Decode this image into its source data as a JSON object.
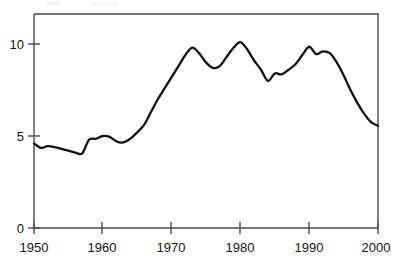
{
  "chart_data": {
    "type": "line",
    "title": "",
    "subtitle": "",
    "xlabel": "",
    "ylabel": "",
    "xlim": [
      1950,
      2000
    ],
    "ylim": [
      0,
      11.6
    ],
    "grid": false,
    "legend": null,
    "series_color": "#111111",
    "x_ticks": [
      1950,
      1960,
      1970,
      1980,
      1990,
      2000
    ],
    "x_tick_labels": [
      "1950",
      "1960",
      "1970",
      "1980",
      "1990",
      "2000"
    ],
    "y_ticks": [
      0,
      5,
      10
    ],
    "y_tick_labels": [
      "0",
      "5",
      "10"
    ],
    "series": [
      {
        "name": "rate",
        "x": [
          1950,
          1951,
          1952,
          1953,
          1954,
          1955,
          1956,
          1957,
          1958,
          1959,
          1960,
          1961,
          1962,
          1963,
          1964,
          1965,
          1966,
          1967,
          1968,
          1969,
          1970,
          1971,
          1972,
          1973,
          1974,
          1975,
          1976,
          1977,
          1978,
          1979,
          1980,
          1981,
          1982,
          1983,
          1984,
          1985,
          1986,
          1987,
          1988,
          1989,
          1990,
          1991,
          1992,
          1993,
          1994,
          1995,
          1996,
          1997,
          1998,
          1999,
          2000
        ],
        "values": [
          4.6,
          4.35,
          4.45,
          4.4,
          4.3,
          4.2,
          4.1,
          4.05,
          4.8,
          4.85,
          5.0,
          4.95,
          4.7,
          4.65,
          4.85,
          5.2,
          5.6,
          6.3,
          7.0,
          7.6,
          8.2,
          8.8,
          9.4,
          9.8,
          9.5,
          9.0,
          8.7,
          8.8,
          9.3,
          9.8,
          10.1,
          9.7,
          9.1,
          8.6,
          8.0,
          8.4,
          8.35,
          8.6,
          8.9,
          9.4,
          9.85,
          9.45,
          9.6,
          9.5,
          9.0,
          8.3,
          7.5,
          6.8,
          6.2,
          5.75,
          5.55
        ]
      }
    ]
  },
  "axes": {
    "y_axis_name": "value-axis",
    "x_axis_name": "year-axis"
  }
}
